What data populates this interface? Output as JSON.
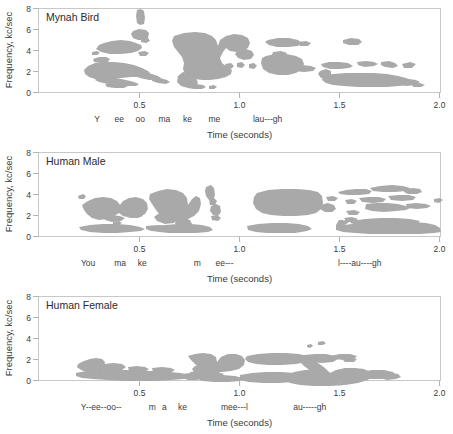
{
  "figure": {
    "width": 453,
    "height": 434,
    "background": "#ffffff",
    "blob_color": "#a9a9a9",
    "frame_color": "#c8c8c8",
    "text_color": "#3a3a3a"
  },
  "axes": {
    "y_label": "Frequency, kc/sec",
    "y_ticks": [
      "0",
      "2",
      "4",
      "6",
      "8"
    ],
    "y_values": [
      0,
      2,
      4,
      6,
      8
    ],
    "y_lim": [
      0,
      8
    ],
    "x_label": "Time (seconds)",
    "x_ticks": [
      "0.5",
      "1.0",
      "1.5",
      "2.0"
    ],
    "x_values": [
      0.5,
      1.0,
      1.5,
      2.0
    ],
    "x_lim": [
      0,
      2.0
    ],
    "grid": false
  },
  "panels": [
    {
      "id": "mynah-bird",
      "title": "Mynah Bird",
      "syllables": [
        {
          "text": "Y",
          "t": 0.29
        },
        {
          "text": "ee",
          "t": 0.4
        },
        {
          "text": "oo",
          "t": 0.505
        },
        {
          "text": "ma",
          "t": 0.625
        },
        {
          "text": "ke",
          "t": 0.74
        },
        {
          "text": "me",
          "t": 0.875
        },
        {
          "text": "lau---gh",
          "t": 1.14
        }
      ]
    },
    {
      "id": "human-male",
      "title": "Human Male",
      "syllables": [
        {
          "text": "You",
          "t": 0.245
        },
        {
          "text": "ma",
          "t": 0.405
        },
        {
          "text": "ke",
          "t": 0.515
        },
        {
          "text": "m",
          "t": 0.79
        },
        {
          "text": "ee---",
          "t": 0.925
        },
        {
          "text": "l----au----gh",
          "t": 1.6
        }
      ]
    },
    {
      "id": "human-female",
      "title": "Human Female",
      "syllables": [
        {
          "text": "Y--ee--oo--",
          "t": 0.31
        },
        {
          "text": "m",
          "t": 0.565
        },
        {
          "text": "a",
          "t": 0.625
        },
        {
          "text": "ke",
          "t": 0.715
        },
        {
          "text": "mee---l",
          "t": 0.975
        },
        {
          "text": "au-----gh",
          "t": 1.35
        }
      ]
    }
  ],
  "chart_data": {
    "type": "heatmap",
    "xlabel": "Time (seconds)",
    "ylabel": "Frequency, kc/sec",
    "xlim": [
      0,
      2.0
    ],
    "ylim": [
      0,
      8
    ],
    "xticks": [
      0.5,
      1.0,
      1.5,
      2.0
    ],
    "yticks": [
      0,
      2,
      4,
      6,
      8
    ],
    "grid": false,
    "legend": "none",
    "series": [
      {
        "name": "Mynah Bird",
        "energy_regions": [
          {
            "label": "Y/ee upper band",
            "t_start": 0.3,
            "t_end": 0.42,
            "f_low": 5.2,
            "f_high": 6.0
          },
          {
            "label": "oo narrow spike",
            "t_start": 0.49,
            "t_end": 0.52,
            "f_low": 6.4,
            "f_high": 7.7
          },
          {
            "label": "oo blob",
            "t_start": 0.475,
            "t_end": 0.53,
            "f_low": 5.5,
            "f_high": 6.3
          },
          {
            "label": "Y/ee descending sweep",
            "t_start": 0.295,
            "t_end": 0.56,
            "f_low": 0.5,
            "f_high": 2.3
          },
          {
            "label": "ma broad band",
            "t_start": 0.59,
            "t_end": 0.8,
            "f_low": 0.7,
            "f_high": 6.4
          },
          {
            "label": "ke fragments",
            "t_start": 0.79,
            "t_end": 0.84,
            "f_low": 2.3,
            "f_high": 2.9
          },
          {
            "label": "me upper",
            "t_start": 0.87,
            "t_end": 0.97,
            "f_low": 5.8,
            "f_high": 6.3
          },
          {
            "label": "me mid",
            "t_start": 0.855,
            "t_end": 1.0,
            "f_low": 2.4,
            "f_high": 4.4
          },
          {
            "label": "laugh upper fleck",
            "t_start": 1.14,
            "t_end": 1.2,
            "f_low": 6.0,
            "f_high": 6.3
          },
          {
            "label": "laugh mid streaks",
            "t_start": 1.12,
            "t_end": 1.46,
            "f_low": 2.5,
            "f_high": 4.1
          },
          {
            "label": "laugh low band",
            "t_start": 1.1,
            "t_end": 1.58,
            "f_low": 0.6,
            "f_high": 2.3
          }
        ]
      },
      {
        "name": "Human Male",
        "energy_regions": [
          {
            "label": "You formants",
            "t_start": 0.2,
            "t_end": 0.38,
            "f_low": 2.6,
            "f_high": 4.2
          },
          {
            "label": "You voice bar",
            "t_start": 0.175,
            "t_end": 0.455,
            "f_low": 0.3,
            "f_high": 0.95
          },
          {
            "label": "make formants",
            "t_start": 0.44,
            "t_end": 0.63,
            "f_low": 1.9,
            "f_high": 4.5
          },
          {
            "label": "ke burst",
            "t_start": 0.695,
            "t_end": 0.73,
            "f_low": 3.9,
            "f_high": 4.8
          },
          {
            "label": "ke fricative",
            "t_start": 0.69,
            "t_end": 0.75,
            "f_low": 2.0,
            "f_high": 2.8
          },
          {
            "label": "make voice bar",
            "t_start": 0.42,
            "t_end": 0.775,
            "f_low": 0.25,
            "f_high": 1.1
          },
          {
            "label": "m-ee formants",
            "t_start": 0.935,
            "t_end": 1.26,
            "f_low": 2.2,
            "f_high": 3.9
          },
          {
            "label": "m-ee voice bar",
            "t_start": 0.86,
            "t_end": 1.41,
            "f_low": 0.2,
            "f_high": 0.85
          },
          {
            "label": "laugh upper bands",
            "t_start": 1.49,
            "t_end": 1.99,
            "f_low": 2.3,
            "f_high": 4.1
          },
          {
            "label": "laugh voice bar",
            "t_start": 1.5,
            "t_end": 1.99,
            "f_low": 0.2,
            "f_high": 1.3
          }
        ]
      },
      {
        "name": "Human Female",
        "energy_regions": [
          {
            "label": "Y-ee-oo onset",
            "t_start": 0.19,
            "t_end": 0.3,
            "f_low": 1.3,
            "f_high": 2.5
          },
          {
            "label": "Y-ee-oo voice bar",
            "t_start": 0.17,
            "t_end": 0.63,
            "f_low": 0.2,
            "f_high": 0.95
          },
          {
            "label": "make band",
            "t_start": 0.6,
            "t_end": 0.8,
            "f_low": 0.6,
            "f_high": 2.5
          },
          {
            "label": "make tail",
            "t_start": 0.71,
            "t_end": 0.86,
            "f_low": 0.25,
            "f_high": 0.9
          },
          {
            "label": "mee-l upper band",
            "t_start": 0.97,
            "t_end": 1.42,
            "f_low": 1.6,
            "f_high": 2.6
          },
          {
            "label": "mee-l voice bar",
            "t_start": 0.92,
            "t_end": 1.35,
            "f_low": 0.2,
            "f_high": 0.95
          },
          {
            "label": "au-gh high fleck",
            "t_start": 1.32,
            "t_end": 1.4,
            "f_low": 3.6,
            "f_high": 4.0
          },
          {
            "label": "au-gh mid fleck",
            "t_start": 1.4,
            "t_end": 1.52,
            "f_low": 1.9,
            "f_high": 2.4
          },
          {
            "label": "au-gh main band",
            "t_start": 1.33,
            "t_end": 1.74,
            "f_low": 0.25,
            "f_high": 1.7
          }
        ]
      }
    ]
  },
  "blob_paths": {
    "mynah": [
      "M 99,45 L 104,43 L 112,41 L 121,40 L 130,41 L 136,43 L 141,45 L 142,48 L 138,51 L 131,53 L 121,54 L 110,54 L 101,52 L 96,49 Z",
      "M 138,52 L 145,51 L 149,53 L 146,56 L 140,56 Z",
      "M 137,10 L 141,9 L 144,11 L 145,18 L 144,24 L 140,25 L 137,23 L 136,16 Z",
      "M 133,31 L 139,29 L 146,30 L 149,33 L 148,38 L 144,40 L 138,40 L 133,38 L 131,34 Z",
      "M 141,38 L 148,38 L 150,41 L 146,43 L 141,42 Z",
      "M 92,52 L 97,51 L 100,53 L 97,55 L 92,55 Z",
      "M 93,59 L 99,57 L 106,57 L 110,59 L 108,62 L 101,63 L 94,62 Z",
      "M 88,66 L 95,63 L 104,62 L 114,62 L 124,63 L 134,65 L 142,68 L 148,71 L 151,74 L 148,76 L 140,77 L 131,77 L 121,78 L 112,79 L 103,80 L 95,79 L 89,77 L 85,74 L 84,70 Z",
      "M 97,78 L 106,77 L 116,78 L 126,80 L 134,82 L 139,84 L 136,86 L 128,86 L 118,85 L 108,84 L 99,82 L 95,80 Z",
      "M 134,74 L 143,73 L 152,74 L 158,76 L 161,78 L 157,80 L 149,80 L 140,78 L 135,76 Z",
      "M 152,78 L 160,78 L 167,80 L 170,82 L 166,84 L 158,83 L 152,81 Z",
      "M 105,84 L 114,83 L 123,84 L 128,86 L 124,88 L 115,88 L 107,87 Z",
      "M 174,36 L 184,33 L 195,32 L 205,33 L 212,36 L 216,40 L 218,46 L 220,40 L 226,36 L 234,34 L 242,35 L 248,38 L 250,43 L 248,48 L 242,51 L 236,52 L 230,51 L 226,48 L 223,52 L 220,58 L 222,63 L 227,67 L 232,70 L 231,74 L 226,77 L 218,79 L 210,80 L 202,80 L 195,79 L 189,77 L 185,74 L 183,69 L 184,63 L 182,57 L 178,52 L 174,47 L 172,41 Z",
      "M 183,72 L 190,74 L 196,78 L 198,83 L 195,87 L 188,88 L 181,86 L 177,82 L 178,76 Z",
      "M 238,50 L 246,49 L 252,51 L 254,55 L 251,59 L 244,60 L 238,58 L 235,54 Z",
      "M 188,85 L 196,84 L 203,85 L 206,87 L 202,89 L 194,89 L 188,88 Z",
      "M 209,86 L 214,85 L 217,87 L 214,89 L 209,89 Z",
      "M 225,64 L 231,63 L 234,66 L 231,69 L 226,68 Z",
      "M 237,63 L 242,62 L 245,65 L 242,68 L 237,67 Z",
      "M 249,64 L 254,63 L 257,66 L 254,69 L 249,68 Z",
      "M 268,40 L 278,38 L 289,38 L 298,40 L 302,43 L 298,46 L 288,47 L 277,47 L 269,45 L 265,42 Z",
      "M 298,42 L 306,41 L 311,43 L 308,46 L 300,46 Z",
      "M 273,52 L 281,51 L 287,53 L 285,56 L 277,57 L 272,55 Z",
      "M 266,56 L 275,54 L 286,54 L 296,56 L 302,59 L 304,64 L 302,69 L 296,73 L 288,75 L 278,75 L 269,73 L 263,69 L 261,63 L 262,58 Z",
      "M 292,66 L 302,65 L 311,66 L 316,68 L 313,71 L 304,72 L 294,71 Z",
      "M 343,40 L 351,38 L 359,39 L 362,42 L 358,45 L 349,45 L 343,43 Z",
      "M 321,64 L 329,62 L 339,62 L 348,63 L 353,66 L 349,68 L 340,69 L 330,69 L 323,67 Z",
      "M 357,62 L 366,61 L 374,62 L 378,64 L 374,66 L 365,67 L 358,65 Z",
      "M 381,62 L 389,61 L 395,63 L 398,66 L 393,68 L 385,67 L 381,65 Z",
      "M 402,64 L 410,62 L 416,64 L 412,68 L 404,68 Z",
      "M 320,71 L 326,69 L 331,71 L 331,76 L 327,79 L 321,78 L 318,74 Z",
      "M 323,76 L 333,74 L 346,73 L 360,73 L 374,73 L 387,74 L 398,76 L 406,78 L 411,80 L 413,83 L 409,85 L 399,86 L 387,87 L 373,87 L 358,87 L 344,86 L 333,85 L 326,83 L 322,80 Z",
      "M 398,80 L 408,79 L 416,80 L 420,82 L 416,85 L 406,86 L 399,84 Z",
      "M 412,84 L 420,83 L 425,85 L 421,87 L 413,87 Z"
    ],
    "male": [
      "M 82,205 L 88,201 L 95,198 L 103,197 L 111,198 L 117,201 L 120,205 L 123,201 L 129,198 L 136,197 L 143,199 L 147,203 L 148,209 L 145,214 L 139,217 L 131,218 L 123,216 L 119,213 L 114,216 L 107,219 L 99,220 L 92,218 L 87,214 L 84,210 Z",
      "M 104,216 L 112,215 L 120,216 L 125,218 L 121,221 L 112,222 L 105,220 Z",
      "M 126,212 L 134,211 L 141,213 L 143,216 L 138,218 L 130,218 L 126,215 Z",
      "M 78,196 L 83,194 L 86,196 L 84,199 L 79,199 Z",
      "M 79,227 L 90,225 L 103,224 L 117,224 L 130,225 L 140,227 L 145,229 L 141,231 L 130,232 L 117,233 L 103,233 L 90,232 L 81,230 Z",
      "M 146,226 L 158,225 L 170,226 L 178,228 L 174,231 L 163,232 L 151,231 L 146,229 Z",
      "M 113,222 L 119,221 L 122,223 L 118,225 L 113,224 Z",
      "M 150,194 L 158,191 L 167,189 L 176,190 L 183,193 L 187,198 L 188,205 L 192,199 L 196,196 L 200,198 L 201,204 L 199,211 L 194,216 L 188,219 L 181,221 L 173,221 L 166,219 L 160,215 L 156,210 L 152,204 L 149,199 Z",
      "M 158,214 L 167,213 L 175,215 L 178,219 L 174,223 L 165,224 L 157,221 L 154,217 Z",
      "M 176,219 L 184,218 L 190,220 L 192,224 L 188,227 L 180,227 L 175,224 Z",
      "M 153,227 L 165,225 L 178,224 L 191,224 L 202,225 L 210,227 L 213,230 L 208,232 L 196,233 L 182,233 L 169,233 L 159,232 L 153,230 Z",
      "M 206,187 L 211,185 L 214,188 L 215,195 L 213,200 L 209,200 L 206,196 L 205,191 Z",
      "M 209,199 L 214,198 L 217,201 L 215,205 L 210,205 Z",
      "M 211,206 L 216,204 L 220,206 L 221,212 L 218,216 L 213,215 L 210,211 Z",
      "M 211,216 L 217,215 L 221,218 L 218,221 L 212,220 Z",
      "M 247,226 L 258,224 L 272,223 L 286,223 L 299,224 L 308,226 L 312,229 L 307,231 L 295,233 L 281,233 L 267,233 L 256,232 L 248,230 Z",
      "M 257,193 L 268,190 L 282,189 L 296,189 L 309,190 L 318,192 L 322,196 L 323,203 L 321,209 L 316,213 L 308,215 L 296,216 L 283,216 L 271,215 L 262,213 L 256,209 L 253,203 L 254,197 Z",
      "M 320,205 L 328,203 L 334,205 L 336,209 L 332,212 L 325,212 L 320,209 Z",
      "M 326,197 L 333,196 L 338,198 L 335,201 L 328,201 Z",
      "M 338,192 L 346,190 L 356,189 L 366,189 L 372,191 L 369,194 L 359,195 L 348,195 L 340,194 Z",
      "M 370,188 L 380,186 L 392,185 L 403,186 L 410,188 L 406,191 L 395,192 L 383,192 L 373,191 Z",
      "M 404,189 L 413,188 L 420,189 L 422,192 L 417,194 L 408,194 L 404,192 Z",
      "M 345,200 L 352,199 L 357,201 L 354,204 L 347,204 Z",
      "M 359,198 L 369,197 L 379,197 L 386,199 L 383,202 L 373,203 L 362,202 Z",
      "M 388,196 L 398,195 L 409,195 L 416,197 L 413,200 L 402,201 L 391,200 Z",
      "M 434,199 L 440,198 L 443,200 L 439,203 L 434,202 Z",
      "M 366,204 L 376,203 L 387,203 L 398,204 L 406,206 L 410,208 L 406,210 L 396,211 L 384,212 L 372,211 L 365,209 Z",
      "M 406,204 L 416,203 L 426,204 L 431,206 L 427,208 L 417,209 L 407,208 Z",
      "M 346,211 L 354,210 L 360,212 L 357,215 L 349,215 Z",
      "M 344,218 L 352,217 L 358,219 L 355,222 L 347,222 Z",
      "M 341,221 L 346,220 L 349,222 L 345,225 L 341,224 Z",
      "M 336,225 L 339,220 L 343,220 L 344,225 L 352,224 L 366,222 L 382,221 L 398,221 L 413,222 L 426,223 L 435,225 L 440,228 L 441,232 L 434,233 L 420,234 L 404,234 L 387,234 L 370,234 L 355,233 L 343,232 L 336,230 Z",
      "M 352,221 L 365,219 L 380,218 L 396,218 L 410,219 L 420,221 L 417,224 L 404,225 L 388,226 L 372,226 L 358,225 L 350,223 Z"
    ],
    "female": [
      "M 78,364 L 84,361 L 90,359 L 96,358 L 102,359 L 105,362 L 104,366 L 100,369 L 94,371 L 87,372 L 81,370 L 77,367 Z",
      "M 95,366 L 104,364 L 114,363 L 122,364 L 126,367 L 122,370 L 113,372 L 103,372 L 96,370 Z",
      "M 99,370 L 105,369 L 109,372 L 107,376 L 102,376 L 98,373 Z",
      "M 76,373 L 86,371 L 99,370 L 113,370 L 128,370 L 143,371 L 157,371 L 170,372 L 181,373 L 188,375 L 190,378 L 184,379 L 171,380 L 156,381 L 140,381 L 124,381 L 108,380 L 93,379 L 82,378 L 76,376 Z",
      "M 128,367 L 137,366 L 145,367 L 149,369 L 145,372 L 136,373 L 129,371 Z",
      "M 152,368 L 162,367 L 171,368 L 175,370 L 170,373 L 160,374 L 153,372 Z",
      "M 188,356 L 195,354 L 203,353 L 211,354 L 216,357 L 217,362 L 221,357 L 228,354 L 236,354 L 242,356 L 245,360 L 244,365 L 239,369 L 231,371 L 222,372 L 213,372 L 205,371 L 199,368 L 195,364 L 191,360 Z",
      "M 195,366 L 203,365 L 210,367 L 212,371 L 208,374 L 200,375 L 194,372 L 192,369 Z",
      "M 190,372 L 199,371 L 209,371 L 218,372 L 224,374 L 220,377 L 210,378 L 199,378 L 191,376 Z",
      "M 182,374 L 190,373 L 198,374 L 202,377 L 197,380 L 188,380 L 182,378 Z",
      "M 198,377 L 210,375 L 223,375 L 235,376 L 243,378 L 240,381 L 228,382 L 214,382 L 203,381 L 197,379 Z",
      "M 245,378 L 253,377 L 259,379 L 256,382 L 248,382 Z",
      "M 247,356 L 258,354 L 272,353 L 286,353 L 299,354 L 308,356 L 311,359 L 307,362 L 296,364 L 282,365 L 268,365 L 256,364 L 248,362 L 245,359 Z",
      "M 304,355 L 315,354 L 326,354 L 335,356 L 338,359 L 333,362 L 322,363 L 310,362 L 304,359 Z",
      "M 301,358 L 310,359 L 318,363 L 325,368 L 330,373 L 327,376 L 319,375 L 311,371 L 304,366 L 299,361 Z",
      "M 318,342 L 323,341 L 326,343 L 323,345 L 318,345 Z",
      "M 307,345 L 311,344 L 313,346 L 310,348 L 307,347 Z",
      "M 330,356 L 340,354 L 350,354 L 357,356 L 354,359 L 344,360 L 334,359 Z",
      "M 341,358 L 350,357 L 357,359 L 354,362 L 345,362 Z",
      "M 240,375 L 252,373 L 266,372 L 281,372 L 295,373 L 306,375 L 311,378 L 306,380 L 294,382 L 279,383 L 263,383 L 249,382 L 240,380 Z",
      "M 294,372 L 305,370 L 316,369 L 325,370 L 330,373 L 336,370 L 345,368 L 355,368 L 364,369 L 370,372 L 372,376 L 368,380 L 358,383 L 345,385 L 330,386 L 314,386 L 300,385 L 290,383 L 285,380 L 287,376 Z",
      "M 360,372 L 372,370 L 384,370 L 393,372 L 396,375 L 391,378 L 380,379 L 368,379 L 360,377 Z",
      "M 380,374 L 390,373 L 398,374 L 401,377 L 396,379 L 387,380 L 380,378 Z"
    ]
  }
}
